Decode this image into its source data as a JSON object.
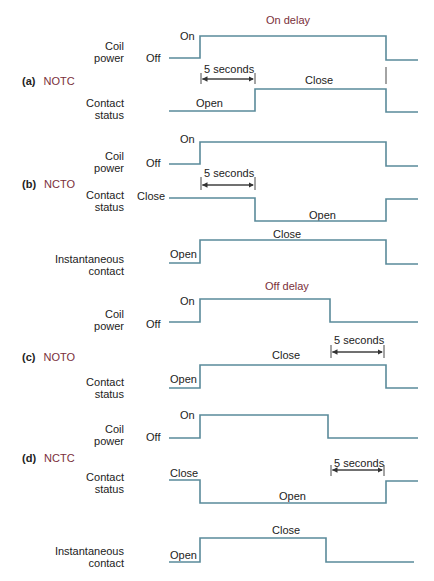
{
  "sections": {
    "on_delay_title": "On delay",
    "off_delay_title": "Off delay"
  },
  "cases": [
    {
      "letter": "(a)",
      "name": "NOTC"
    },
    {
      "letter": "(b)",
      "name": "NCTO"
    },
    {
      "letter": "(c)",
      "name": "NOTO"
    },
    {
      "letter": "(d)",
      "name": "NCTC"
    }
  ],
  "labels": {
    "coil": "Coil",
    "power": "power",
    "contact": "Contact",
    "status": "status",
    "instantaneous": "Instantaneous",
    "contact_lower": "contact",
    "on": "On",
    "off": "Off",
    "open": "Open",
    "close": "Close",
    "delay": "5 seconds"
  },
  "colors": {
    "waveform": "#5a8a9a",
    "title": "#7a2f3a"
  }
}
